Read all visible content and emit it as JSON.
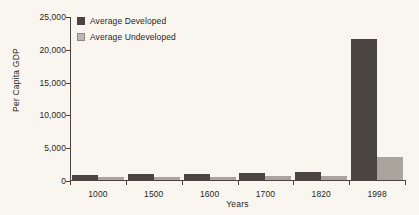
{
  "chart_data": {
    "type": "bar",
    "title": "",
    "xlabel": "Years",
    "ylabel": "Per Capita GDP",
    "categories": [
      "1000",
      "1500",
      "1600",
      "1700",
      "1820",
      "1998"
    ],
    "series": [
      {
        "name": "Average Developed",
        "color": "#4a4540",
        "values": [
          700,
          900,
          950,
          1000,
          1200,
          21500
        ]
      },
      {
        "name": "Average Undeveloped",
        "color": "#a9a59c",
        "values": [
          450,
          500,
          500,
          550,
          600,
          3500
        ]
      }
    ],
    "ylim": [
      0,
      25000
    ],
    "yticks": [
      0,
      5000,
      10000,
      15000,
      20000,
      25000
    ],
    "ytick_labels": [
      "0",
      "5,000",
      "10,000",
      "15,000",
      "20,000",
      "25,000"
    ],
    "grid": false,
    "legend_position": "top-left"
  },
  "legend": {
    "items": [
      {
        "label": "Average Developed"
      },
      {
        "label": "Average Undeveloped"
      }
    ]
  },
  "colors": {
    "background": "#f8f6ef",
    "axis": "#4a443e",
    "developed": "#4a4540",
    "undeveloped": "#a9a59c"
  }
}
